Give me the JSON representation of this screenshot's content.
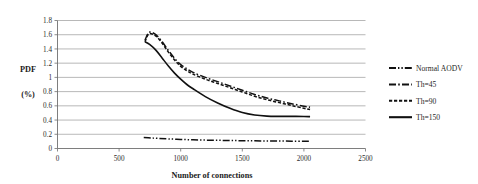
{
  "chart_data": {
    "type": "line",
    "title": "",
    "xlabel": "Number of connections",
    "ylabel_line1": "PDF",
    "ylabel_line2": "(%)",
    "xlim": [
      0,
      2500
    ],
    "ylim": [
      0,
      1.8
    ],
    "xticks": [
      "0",
      "500",
      "1000",
      "1500",
      "2000",
      "2500"
    ],
    "xtick_values": [
      0,
      500,
      1000,
      1500,
      2000,
      2500
    ],
    "yticks": [
      "0",
      "0.2",
      "0.4",
      "0.6",
      "0.8",
      "1",
      "1.2",
      "1.4",
      "1.6",
      "1.8"
    ],
    "ytick_values": [
      0,
      0.2,
      0.4,
      0.6,
      0.8,
      1.0,
      1.2,
      1.4,
      1.6,
      1.8
    ],
    "grid": "horizontal",
    "legend_position": "right",
    "series": [
      {
        "name": "Normal AODV",
        "style": "dash-dot-dot",
        "dasharray": "7,2,1.4,2,1.4,2",
        "width": 1.5,
        "x": [
          700,
          760,
          820,
          900,
          1000,
          1100,
          1200,
          1300,
          1400,
          1500,
          1600,
          1700,
          1800,
          1900,
          2000,
          2050
        ],
        "y": [
          0.155,
          0.148,
          0.142,
          0.135,
          0.128,
          0.122,
          0.118,
          0.115,
          0.112,
          0.11,
          0.108,
          0.106,
          0.105,
          0.103,
          0.102,
          0.101
        ]
      },
      {
        "name": "Th=45",
        "style": "dash-dot",
        "dasharray": "7,2.2,1.6,2.2",
        "width": 1.5,
        "x": [
          710,
          735,
          760,
          800,
          850,
          900,
          950,
          1000,
          1050,
          1100,
          1200,
          1300,
          1400,
          1500,
          1600,
          1700,
          1800,
          1900,
          2000,
          2050
        ],
        "y": [
          1.52,
          1.62,
          1.635,
          1.6,
          1.5,
          1.38,
          1.27,
          1.18,
          1.12,
          1.07,
          1.0,
          0.94,
          0.88,
          0.82,
          0.76,
          0.71,
          0.67,
          0.63,
          0.595,
          0.58
        ]
      },
      {
        "name": "Th=90",
        "style": "dashed",
        "dasharray": "3.2,1.8",
        "width": 1.5,
        "x": [
          710,
          735,
          760,
          800,
          850,
          900,
          950,
          1000,
          1050,
          1100,
          1200,
          1300,
          1400,
          1500,
          1600,
          1700,
          1800,
          1900,
          2000,
          2050
        ],
        "y": [
          1.5,
          1.6,
          1.615,
          1.58,
          1.48,
          1.355,
          1.245,
          1.155,
          1.095,
          1.045,
          0.975,
          0.915,
          0.855,
          0.795,
          0.735,
          0.685,
          0.645,
          0.605,
          0.565,
          0.55
        ]
      },
      {
        "name": "Th=150",
        "style": "solid",
        "dasharray": "none",
        "width": 1.6,
        "x": [
          710,
          750,
          800,
          850,
          900,
          950,
          1000,
          1050,
          1100,
          1200,
          1300,
          1400,
          1500,
          1600,
          1700,
          1800,
          1900,
          2000,
          2050
        ],
        "y": [
          1.5,
          1.46,
          1.38,
          1.27,
          1.16,
          1.06,
          0.975,
          0.9,
          0.84,
          0.73,
          0.64,
          0.565,
          0.505,
          0.47,
          0.455,
          0.452,
          0.452,
          0.45,
          0.448
        ]
      }
    ],
    "legend_entries": [
      {
        "label": "Normal AODV"
      },
      {
        "label": "Th=45"
      },
      {
        "label": "Th=90"
      },
      {
        "label": "Th=150"
      }
    ]
  }
}
